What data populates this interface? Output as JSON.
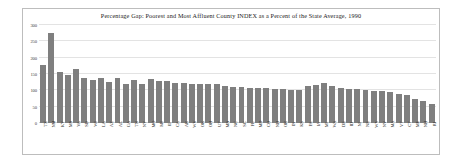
{
  "chart_data": {
    "type": "bar",
    "title": "Percentage Gap: Poorest and Most Affluent County INDEX as a Percent of the State Average, 1990",
    "xlabel": "",
    "ylabel": "",
    "ylim": [
      0,
      300
    ],
    "yticks": [
      0,
      50,
      100,
      150,
      200,
      250,
      300
    ],
    "grid": true,
    "legend": "none",
    "bar_color": "#7f7f7f",
    "categories": [
      "TX",
      "NM",
      "KY",
      "MS",
      "VA",
      "SD",
      "WI",
      "LA",
      "AZ",
      "AL",
      "GA",
      "TN",
      "NY",
      "MO",
      "MI",
      "IL",
      "CA",
      "AR",
      "WV",
      "OK",
      "OH",
      "UT",
      "MN",
      "NC",
      "SC",
      "FL",
      "MD",
      "CO",
      "ND",
      "OR",
      "IN",
      "KS",
      "PA",
      "IA",
      "MT",
      "WA",
      "DE",
      "ID",
      "NJ",
      "NE",
      "WY",
      "NV",
      "MA",
      "VT",
      "CT",
      "ME",
      "NH",
      "RI"
    ],
    "values": [
      178,
      275,
      157,
      148,
      165,
      137,
      131,
      137,
      125,
      138,
      120,
      131,
      120,
      134,
      128,
      128,
      124,
      121,
      119,
      118,
      118,
      118,
      112,
      111,
      110,
      108,
      108,
      106,
      104,
      104,
      100,
      100,
      113,
      115,
      121,
      113,
      107,
      105,
      104,
      100,
      98,
      97,
      96,
      89,
      85,
      75,
      68,
      57
    ]
  }
}
